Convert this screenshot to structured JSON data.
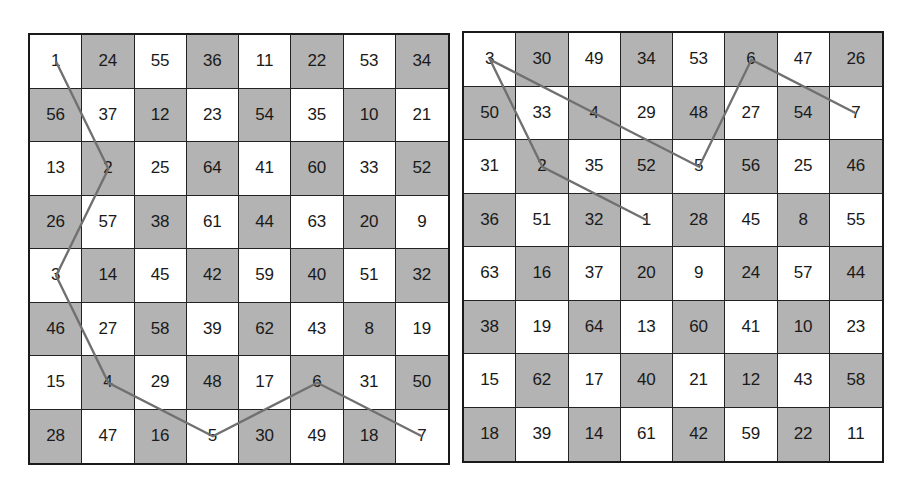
{
  "boards": [
    {
      "name": "left-board",
      "cells": [
        [
          1,
          24,
          55,
          36,
          11,
          22,
          53,
          34
        ],
        [
          56,
          37,
          12,
          23,
          54,
          35,
          10,
          21
        ],
        [
          13,
          2,
          25,
          64,
          41,
          60,
          33,
          52
        ],
        [
          26,
          57,
          38,
          61,
          44,
          63,
          20,
          9
        ],
        [
          3,
          14,
          45,
          42,
          59,
          40,
          51,
          32
        ],
        [
          46,
          27,
          58,
          39,
          62,
          43,
          8,
          19
        ],
        [
          15,
          4,
          29,
          48,
          17,
          6,
          31,
          50
        ],
        [
          28,
          47,
          16,
          5,
          30,
          49,
          18,
          7
        ]
      ],
      "path": [
        1,
        2,
        3,
        4,
        5,
        6,
        7
      ]
    },
    {
      "name": "right-board",
      "cells": [
        [
          3,
          30,
          49,
          34,
          53,
          6,
          47,
          26
        ],
        [
          50,
          33,
          4,
          29,
          48,
          27,
          54,
          7
        ],
        [
          31,
          2,
          35,
          52,
          5,
          56,
          25,
          46
        ],
        [
          36,
          51,
          32,
          1,
          28,
          45,
          8,
          55
        ],
        [
          63,
          16,
          37,
          20,
          9,
          24,
          57,
          44
        ],
        [
          38,
          19,
          64,
          13,
          60,
          41,
          10,
          23
        ],
        [
          15,
          62,
          17,
          40,
          21,
          12,
          43,
          58
        ],
        [
          18,
          39,
          14,
          61,
          42,
          59,
          22,
          11
        ]
      ],
      "path": [
        1,
        2,
        3,
        4,
        5,
        6,
        7
      ]
    }
  ],
  "colors": {
    "dark_cell": "#b3b3b3",
    "light_cell": "#ffffff",
    "path_line": "#707070",
    "grid_line": "#222222"
  }
}
